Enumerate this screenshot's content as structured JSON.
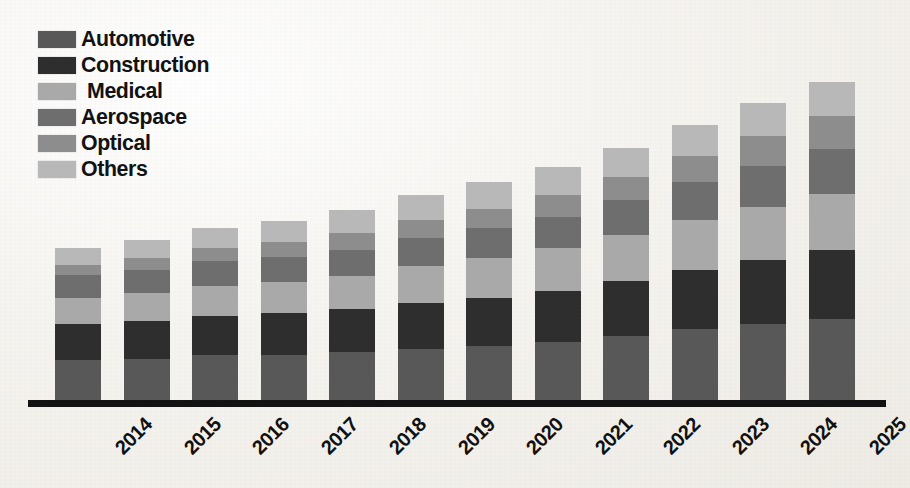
{
  "legend": {
    "items": [
      {
        "label": "Automotive",
        "color": "#585858",
        "indent": false
      },
      {
        "label": "Construction",
        "color": "#2e2e2e",
        "indent": false
      },
      {
        "label": "Medical",
        "color": "#a9a9a9",
        "indent": true
      },
      {
        "label": "Aerospace",
        "color": "#6e6e6e",
        "indent": false
      },
      {
        "label": "Optical",
        "color": "#8d8d8d",
        "indent": false
      },
      {
        "label": "Others",
        "color": "#b8b8b8",
        "indent": false
      }
    ]
  },
  "axis": {
    "line_color": "#131313"
  },
  "chart_data": {
    "type": "bar",
    "subtype": "stacked-vertical",
    "title": "",
    "xlabel": "",
    "ylabel": "",
    "grid": false,
    "legend_position": "top-left",
    "axis_visible": {
      "x": true,
      "y": false
    },
    "categories": [
      "2014",
      "2015",
      "2016",
      "2017",
      "2018",
      "2019",
      "2020",
      "2021",
      "2022",
      "2023",
      "2024",
      "2025"
    ],
    "series": [
      {
        "name": "Automotive",
        "color": "#585858",
        "values": [
          48,
          50,
          54,
          55,
          58,
          62,
          66,
          70,
          78,
          86,
          92,
          98
        ]
      },
      {
        "name": "Construction",
        "color": "#2e2e2e",
        "values": [
          44,
          46,
          48,
          50,
          52,
          56,
          58,
          62,
          66,
          72,
          78,
          84
        ]
      },
      {
        "name": "Medical",
        "color": "#a9a9a9",
        "values": [
          32,
          34,
          36,
          38,
          40,
          44,
          48,
          52,
          56,
          60,
          64,
          68
        ]
      },
      {
        "name": "Aerospace",
        "color": "#6e6e6e",
        "values": [
          28,
          28,
          30,
          30,
          32,
          34,
          36,
          38,
          42,
          46,
          50,
          54
        ]
      },
      {
        "name": "Optical",
        "color": "#8d8d8d",
        "values": [
          12,
          14,
          16,
          18,
          20,
          22,
          24,
          26,
          28,
          32,
          36,
          40
        ]
      },
      {
        "name": "Others",
        "color": "#b8b8b8",
        "values": [
          20,
          22,
          24,
          26,
          28,
          30,
          32,
          34,
          36,
          38,
          40,
          42
        ]
      }
    ],
    "totals": [
      184,
      194,
      208,
      217,
      230,
      248,
      264,
      282,
      306,
      334,
      360,
      386
    ],
    "ylim": [
      0,
      400
    ],
    "stack_order_bottom_to_top": [
      "Automotive",
      "Construction",
      "Medical",
      "Aerospace",
      "Optical",
      "Others"
    ]
  }
}
